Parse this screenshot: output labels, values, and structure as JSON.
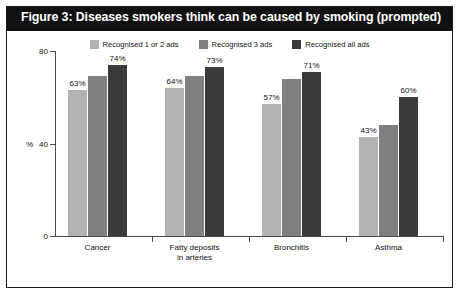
{
  "figure": {
    "title": "Figure 3: Diseases smokers think can be caused by smoking (prompted)"
  },
  "chart_data": {
    "type": "bar",
    "title": "Figure 3: Diseases smokers think can be caused by smoking (prompted)",
    "xlabel": "",
    "ylabel": "%",
    "ylim": [
      0,
      80
    ],
    "yticks": [
      0,
      40,
      80
    ],
    "grid": false,
    "legend_position": "top-center",
    "categories": [
      "Cancer",
      "Fatty deposits in arteries",
      "Bronchitis",
      "Asthma"
    ],
    "category_lines": [
      [
        "Cancer"
      ],
      [
        "Fatty deposits",
        "in arteries"
      ],
      [
        "Bronchitis"
      ],
      [
        "Asthma"
      ]
    ],
    "series": [
      {
        "name": "Recognised 1 or 2 ads",
        "color": "#b3b3b3",
        "values": [
          63,
          64,
          57,
          43
        ],
        "labels": [
          "63%",
          "64%",
          "57%",
          "43%"
        ]
      },
      {
        "name": "Recognised 3 ads",
        "color": "#808080",
        "values": [
          69,
          69,
          68,
          48
        ],
        "labels": [
          "",
          "",
          "",
          ""
        ]
      },
      {
        "name": "Recognised all ads",
        "color": "#3a3a3a",
        "values": [
          74,
          73,
          71,
          60
        ],
        "labels": [
          "74%",
          "73%",
          "71%",
          "60%"
        ]
      }
    ]
  },
  "legend": {
    "items": [
      {
        "label": "Recognised 1 or 2 ads",
        "color": "#b3b3b3"
      },
      {
        "label": "Recognised 3 ads",
        "color": "#808080"
      },
      {
        "label": "Recognised all ads",
        "color": "#3a3a3a"
      }
    ]
  },
  "axis": {
    "y_ticks": [
      {
        "label": "80",
        "value": 80
      },
      {
        "label": "40",
        "value": 40
      },
      {
        "label": "0",
        "value": 0
      }
    ],
    "y_axis_label": "%"
  },
  "colors": {
    "title_bar": "#111111",
    "title_text": "#ffffff",
    "frame_border": "#1a1a1a",
    "axis": "#4a4a4a",
    "background": "#ffffff"
  }
}
